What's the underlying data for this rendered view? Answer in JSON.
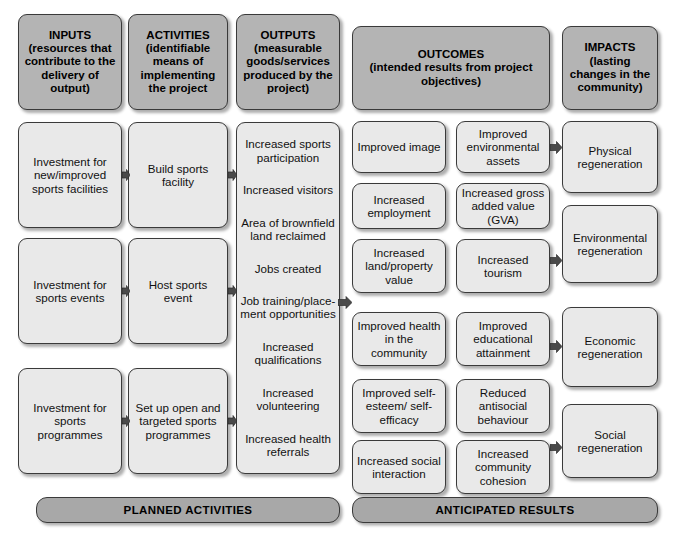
{
  "diagram": {
    "colors": {
      "header_fill": "#b4b4b4",
      "node_fill": "#e9e9e9",
      "banner_fill": "#a8a8a8",
      "border": "#3a3a3a",
      "background": "#ffffff",
      "text": "#111111"
    }
  },
  "headers": [
    {
      "title": "INPUTS",
      "subtitle": "(resources that contribute to the delivery of output)"
    },
    {
      "title": "ACTIVITIES",
      "subtitle": "(identifiable means of implementing the project"
    },
    {
      "title": "OUTPUTS",
      "subtitle": "(measurable goods/services produced by the project)"
    },
    {
      "title": "OUTCOMES",
      "subtitle": "(intended results from project objectives)"
    },
    {
      "title": "IMPACTS",
      "subtitle": "(lasting changes in the community)"
    }
  ],
  "inputs": [
    {
      "label": "Investment for new/improved sports facilities"
    },
    {
      "label": "Investment for sports events"
    },
    {
      "label": "Investment for sports programmes"
    }
  ],
  "activities": [
    {
      "label": "Build sports facility"
    },
    {
      "label": "Host sports event"
    },
    {
      "label": "Set up open and targeted sports programmes"
    }
  ],
  "outputs": [
    {
      "label": "Increased sports participation"
    },
    {
      "label": "Increased visitors"
    },
    {
      "label": "Area of brownfield land reclaimed"
    },
    {
      "label": "Jobs created"
    },
    {
      "label": "Job training/place-ment opportunities"
    },
    {
      "label": "Increased qualifications"
    },
    {
      "label": "Increased volunteering"
    },
    {
      "label": "Increased health referrals"
    }
  ],
  "outcomes_col1": [
    {
      "label": "Improved image"
    },
    {
      "label": "Increased employment"
    },
    {
      "label": "Increased land/property value"
    },
    {
      "label": "Improved health in the community"
    },
    {
      "label": "Improved self-esteem/ self-efficacy"
    },
    {
      "label": "Increased social interaction"
    }
  ],
  "outcomes_col2": [
    {
      "label": "Improved environmental assets"
    },
    {
      "label": "Increased gross added value (GVA)"
    },
    {
      "label": "Increased tourism"
    },
    {
      "label": "Improved educational attainment"
    },
    {
      "label": "Reduced antisocial behaviour"
    },
    {
      "label": "Increased community cohesion"
    }
  ],
  "impacts": [
    {
      "label": "Physical regeneration"
    },
    {
      "label": "Environmental regeneration"
    },
    {
      "label": "Economic regeneration"
    },
    {
      "label": "Social regeneration"
    }
  ],
  "banners": [
    {
      "label": "PLANNED ACTIVITIES"
    },
    {
      "label": "ANTICIPATED RESULTS"
    }
  ]
}
